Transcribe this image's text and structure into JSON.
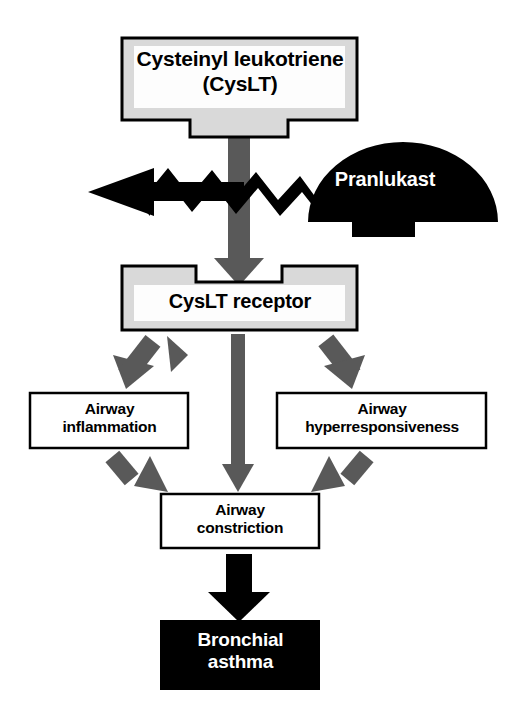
{
  "diagram": {
    "colors": {
      "background": "#ffffff",
      "outline": "#000000",
      "box_fill_light": "#ffffff",
      "box_fill_shade": "#d9d9d9",
      "arrow_gray": "#595959",
      "arrow_black": "#000000",
      "text_dark": "#000000",
      "text_light": "#ffffff"
    },
    "nodes": {
      "ligand": {
        "label": "Cysteinyl leukotriene\n(CysLT)",
        "style": "shaded-box-with-bottom-tab"
      },
      "drug": {
        "label": "Pranlukast",
        "style": "black-dome-with-bottom-tab"
      },
      "receptor": {
        "label": "CysLT receptor",
        "style": "shaded-box-with-top-notch"
      },
      "inflammation": {
        "label": "Airway\ninflammation",
        "style": "outlined-box"
      },
      "hyperresponsiveness": {
        "label": "Airway\nhyperresponsiveness",
        "style": "outlined-box"
      },
      "constriction": {
        "label": "Airway\nconstriction",
        "style": "outlined-box"
      },
      "asthma": {
        "label": "Bronchial\nasthma",
        "style": "solid-black-box"
      }
    },
    "connectors": [
      {
        "name": "ligand-to-receptor",
        "from": "ligand",
        "to": "receptor",
        "style": "thick-gray-down-arrow"
      },
      {
        "name": "pranlukast-block",
        "from": "drug",
        "to": "ligand-signal",
        "style": "black-zigzag-left-arrow",
        "meaning": "blocks"
      },
      {
        "name": "receptor-to-inflammation",
        "from": "receptor",
        "to": "inflammation",
        "style": "gray-diagonal-arrow-left"
      },
      {
        "name": "receptor-to-hyperresponsiveness",
        "from": "receptor",
        "to": "hyperresponsiveness",
        "style": "gray-diagonal-arrow-right"
      },
      {
        "name": "receptor-to-constriction",
        "from": "receptor",
        "to": "constriction",
        "style": "gray-straight-down-arrow"
      },
      {
        "name": "inflammation-to-constriction",
        "from": "inflammation",
        "to": "constriction",
        "style": "gray-diagonal-arrow-right"
      },
      {
        "name": "hyperresponsiveness-to-constriction",
        "from": "hyperresponsiveness",
        "to": "constriction",
        "style": "gray-diagonal-arrow-left"
      },
      {
        "name": "constriction-to-asthma",
        "from": "constriction",
        "to": "asthma",
        "style": "thick-black-down-arrow"
      }
    ]
  }
}
